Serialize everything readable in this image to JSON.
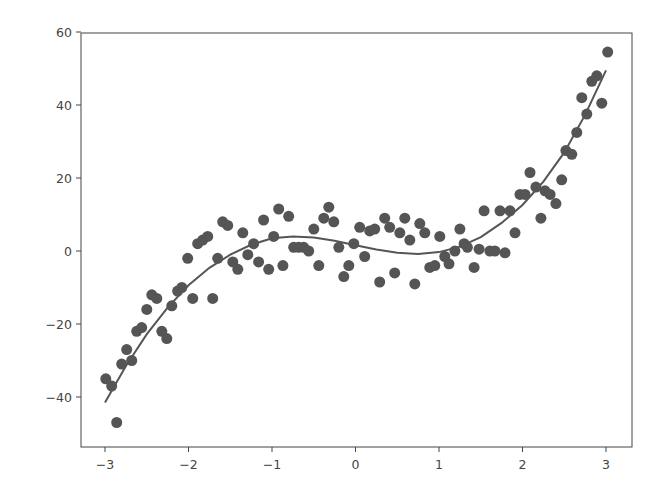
{
  "chart_data": {
    "type": "scatter",
    "title": "",
    "xlabel": "",
    "ylabel": "",
    "xlim": [
      -3.3,
      3.3
    ],
    "ylim": [
      -52,
      60
    ],
    "grid": false,
    "legend": null,
    "x_ticks": [
      -3,
      -2,
      -1,
      0,
      1,
      2,
      3
    ],
    "x_tick_labels": [
      "−3",
      "−2",
      "−1",
      "0",
      "1",
      "2",
      "3"
    ],
    "y_ticks": [
      -40,
      -20,
      0,
      20,
      40,
      60
    ],
    "y_tick_labels": [
      "−40",
      "−20",
      "0",
      "20",
      "40",
      "60"
    ],
    "colors": {
      "points": "#555555",
      "line": "#555555",
      "axes": "#444444"
    },
    "series": [
      {
        "name": "data points",
        "kind": "scatter",
        "x": [
          -2.99,
          -2.92,
          -2.86,
          -2.8,
          -2.74,
          -2.68,
          -2.62,
          -2.56,
          -2.5,
          -2.44,
          -2.38,
          -2.32,
          -2.26,
          -2.2,
          -2.13,
          -2.08,
          -2.01,
          -1.95,
          -1.89,
          -1.83,
          -1.77,
          -1.71,
          -1.65,
          -1.59,
          -1.53,
          -1.47,
          -1.41,
          -1.35,
          -1.29,
          -1.22,
          -1.16,
          -1.1,
          -1.04,
          -0.98,
          -0.92,
          -0.87,
          -0.8,
          -0.74,
          -0.68,
          -0.62,
          -0.56,
          -0.5,
          -0.44,
          -0.38,
          -0.32,
          -0.26,
          -0.2,
          -0.14,
          -0.08,
          -0.02,
          0.05,
          0.11,
          0.17,
          0.23,
          0.29,
          0.35,
          0.41,
          0.47,
          0.53,
          0.59,
          0.65,
          0.71,
          0.77,
          0.83,
          0.89,
          0.95,
          1.01,
          1.07,
          1.12,
          1.19,
          1.25,
          1.3,
          1.34,
          1.42,
          1.48,
          1.54,
          1.61,
          1.67,
          1.73,
          1.79,
          1.85,
          1.91,
          1.97,
          2.03,
          2.09,
          2.16,
          2.22,
          2.27,
          2.33,
          2.4,
          2.47,
          2.52,
          2.59,
          2.65,
          2.71,
          2.77,
          2.83,
          2.89,
          2.95,
          3.02
        ],
        "y": [
          -35,
          -37,
          -47,
          -31,
          -27,
          -30,
          -22,
          -21,
          -16,
          -12,
          -13,
          -22,
          -24,
          -15,
          -11,
          -10,
          -2,
          -13,
          2,
          3,
          4,
          -13,
          -2,
          8,
          7,
          -3,
          -5,
          5,
          -1,
          2,
          -3,
          8.5,
          -5,
          4,
          11.5,
          -4,
          9.5,
          1,
          1,
          1,
          0,
          6,
          -4,
          9,
          12,
          8,
          1,
          -7,
          -4,
          2,
          6.5,
          -1.5,
          5.5,
          6,
          -8.5,
          9,
          6.5,
          -6,
          5,
          9,
          3,
          -9,
          7.5,
          5,
          -4.5,
          -4,
          4,
          -1.5,
          -3.5,
          0,
          6,
          2,
          1,
          -4.5,
          0.5,
          11,
          0,
          0,
          11,
          -0.5,
          11,
          5,
          15.5,
          15.5,
          21.5,
          17.5,
          9,
          16.5,
          15.5,
          13,
          19.5,
          27.5,
          26.5,
          32.5,
          42,
          37.5,
          46.5,
          48,
          40.5,
          54.5
        ]
      },
      {
        "name": "cubic fit",
        "kind": "line",
        "x": [
          -3.0,
          -2.75,
          -2.5,
          -2.25,
          -2.0,
          -1.75,
          -1.5,
          -1.25,
          -1.0,
          -0.75,
          -0.5,
          -0.25,
          0.0,
          0.25,
          0.5,
          0.75,
          1.0,
          1.25,
          1.5,
          1.75,
          2.0,
          2.25,
          2.5,
          2.75,
          3.0
        ],
        "y": [
          -41.5,
          -31.5,
          -22.8,
          -15.5,
          -9.4,
          -4.6,
          -1.0,
          1.7,
          3.5,
          4.0,
          3.7,
          2.8,
          1.6,
          0.4,
          -0.5,
          -0.8,
          -0.3,
          1.2,
          3.8,
          7.7,
          12.6,
          19.0,
          27.0,
          37.3,
          49.5
        ]
      }
    ]
  }
}
